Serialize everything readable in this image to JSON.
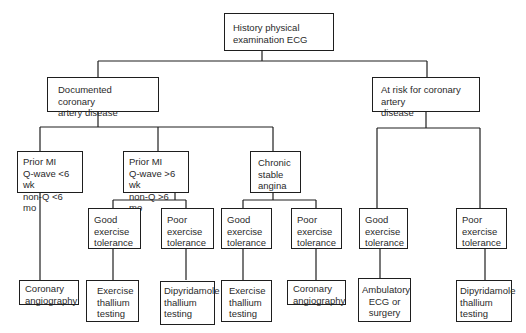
{
  "diagram": {
    "type": "decision-flowchart",
    "nodes": {
      "root": "History physical\nexamination ECG",
      "documented_cad": "Documented coronary\nartery disease",
      "at_risk_cad": "At risk for coronary artery\ndisease",
      "prior_mi_recent": "Prior MI\nQ-wave <6 wk\nnon-Q <6 mo",
      "prior_mi_old": "Prior MI\nQ-wave >6 wk\nnon-Q >6 mo",
      "chronic_stable_angina": "Chronic\nstable\nangina",
      "old_mi_good": "Good\nexercise\ntolerance",
      "old_mi_poor": "Poor\nexercise\ntolerance",
      "angina_good": "Good\nexercise\ntolerance",
      "angina_poor": "Poor\nexercise\ntolerance",
      "risk_good": "Good\nexercise\ntolerance",
      "risk_poor": "Poor\nexercise\ntolerance",
      "result_recent_mi": "Coronary\nangiography",
      "result_old_mi_good": "Exercise\nthallium\ntesting",
      "result_old_mi_poor": "Dipyridamole\nthallium\ntesting",
      "result_angina_good": "Exercise\nthallium\ntesting",
      "result_angina_poor": "Coronary\nangiography",
      "result_risk_good": "Ambulatory\nECG or\nsurgery",
      "result_risk_poor": "Dipyridamole\nthallium\ntesting"
    },
    "edges": [
      [
        "root",
        "documented_cad"
      ],
      [
        "root",
        "at_risk_cad"
      ],
      [
        "documented_cad",
        "prior_mi_recent"
      ],
      [
        "documented_cad",
        "prior_mi_old"
      ],
      [
        "documented_cad",
        "chronic_stable_angina"
      ],
      [
        "prior_mi_old",
        "old_mi_good"
      ],
      [
        "prior_mi_old",
        "old_mi_poor"
      ],
      [
        "chronic_stable_angina",
        "angina_good"
      ],
      [
        "chronic_stable_angina",
        "angina_poor"
      ],
      [
        "at_risk_cad",
        "risk_good"
      ],
      [
        "at_risk_cad",
        "risk_poor"
      ],
      [
        "prior_mi_recent",
        "result_recent_mi"
      ],
      [
        "old_mi_good",
        "result_old_mi_good"
      ],
      [
        "old_mi_poor",
        "result_old_mi_poor"
      ],
      [
        "angina_good",
        "result_angina_good"
      ],
      [
        "angina_poor",
        "result_angina_poor"
      ],
      [
        "risk_good",
        "result_risk_good"
      ],
      [
        "risk_poor",
        "result_risk_poor"
      ]
    ],
    "colors": {
      "line": "#1e1e1e",
      "text": "#2a2a2a",
      "background": "#ffffff"
    }
  }
}
